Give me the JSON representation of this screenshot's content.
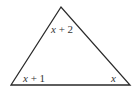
{
  "diagram": {
    "type": "triangle",
    "vertices": {
      "apex": [
        61,
        7
      ],
      "bottom_left": [
        11,
        85
      ],
      "bottom_right": [
        130,
        85
      ]
    },
    "stroke_color": "#2a2a2a",
    "angle_labels": {
      "apex": {
        "var": "x",
        "rest": " + 2"
      },
      "bottom_left": {
        "var": "x",
        "rest": " + 1"
      },
      "bottom_right": {
        "var": "x",
        "rest": ""
      }
    }
  }
}
